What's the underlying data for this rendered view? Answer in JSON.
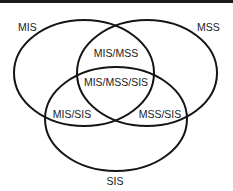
{
  "diagram": {
    "type": "venn",
    "sets": [
      {
        "id": "MIS",
        "label": "MIS"
      },
      {
        "id": "MSS",
        "label": "MSS"
      },
      {
        "id": "SIS",
        "label": "SIS"
      }
    ],
    "intersections": [
      {
        "sets": [
          "MIS",
          "MSS"
        ],
        "label": "MIS/MSS"
      },
      {
        "sets": [
          "MIS",
          "MSS",
          "SIS"
        ],
        "label": "MIS/MSS/SIS"
      },
      {
        "sets": [
          "MIS",
          "SIS"
        ],
        "label": "MIS/SIS"
      },
      {
        "sets": [
          "MSS",
          "SIS"
        ],
        "label": "MSS/SIS"
      }
    ]
  }
}
